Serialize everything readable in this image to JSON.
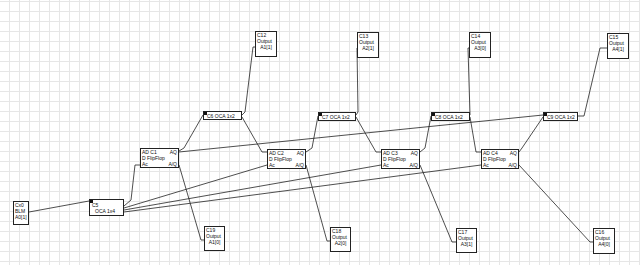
{
  "diagram": {
    "outputs_top": [
      {
        "id": "C12",
        "type": "Output",
        "signal": "A1[1]"
      },
      {
        "id": "C13",
        "type": "Output",
        "signal": "A2[1]"
      },
      {
        "id": "C14",
        "type": "Output",
        "signal": "A3[0]"
      },
      {
        "id": "C15",
        "type": "Output",
        "signal": "A4[1]"
      }
    ],
    "outputs_bottom": [
      {
        "id": "C19",
        "type": "Output",
        "signal": "A1[0]"
      },
      {
        "id": "C18",
        "type": "Output",
        "signal": "A2[0]"
      },
      {
        "id": "C17",
        "type": "Output",
        "signal": "A3[1]"
      },
      {
        "id": "C16",
        "type": "Output",
        "signal": "A4[0]"
      }
    ],
    "ocas": [
      {
        "label": "C6  OCA 1x2"
      },
      {
        "label": "C7  OCA 1x2"
      },
      {
        "label": "C8  OCA 1x2"
      },
      {
        "label": "C9  OCA 1x2"
      }
    ],
    "flipflops": [
      {
        "pin_d": "AD",
        "id": "C1",
        "q": "AQ",
        "type": "D FlipFlop",
        "clk": "Ac",
        "nq": "A/Q"
      },
      {
        "pin_d": "AD",
        "id": "C2",
        "q": "AQ",
        "type": "D FlipFlop",
        "clk": "Ac",
        "nq": "A/Q"
      },
      {
        "pin_d": "AD",
        "id": "C3",
        "q": "AQ",
        "type": "D FlipFlop",
        "clk": "Ac",
        "nq": "A/Q"
      },
      {
        "pin_d": "AD",
        "id": "C4",
        "q": "AQ",
        "type": "D FlipFlop",
        "clk": "Ac",
        "nq": "A/Q"
      }
    ],
    "splitter": {
      "id": "C5",
      "label": "OCA 1x4"
    },
    "source": {
      "id": "Cx0",
      "type": "BLM",
      "signal": "A0[1]"
    }
  }
}
